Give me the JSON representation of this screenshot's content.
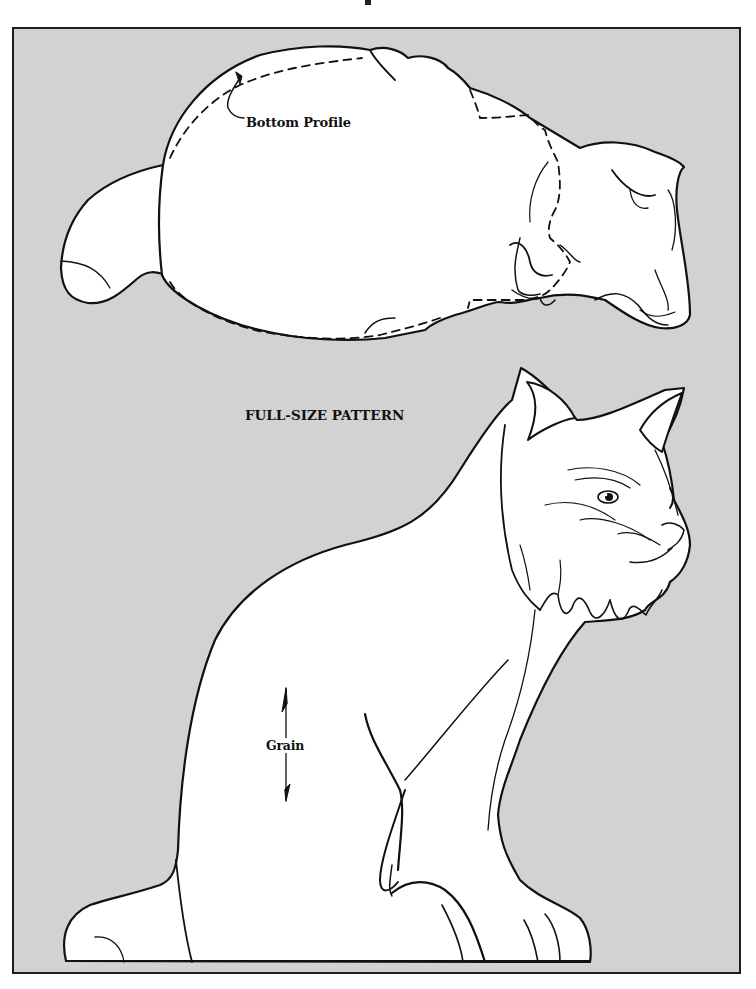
{
  "page": {
    "background": "#ffffff",
    "panel_color": "#d2d2d2",
    "line_color": "#111111",
    "fill_color": "#ffffff"
  },
  "labels": {
    "bottom_profile": "Bottom Profile",
    "title": "FULL-SIZE PATTERN",
    "grain": "Grain"
  },
  "figures": {
    "top_view": {
      "name": "top-view-cat-pattern",
      "has_dashed_bottom_profile": true
    },
    "side_view": {
      "name": "side-view-sitting-bobcat-pattern",
      "has_grain_arrow": true
    }
  }
}
